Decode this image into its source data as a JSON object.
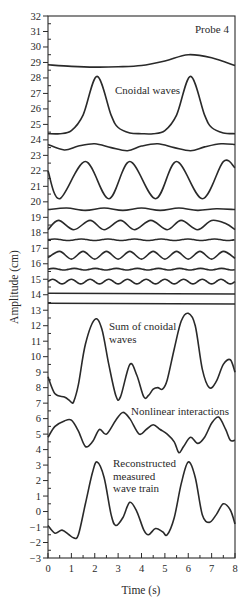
{
  "chart_data": {
    "type": "line",
    "title": "",
    "annotation_title": "Probe 4",
    "xlabel": "Time (s)",
    "ylabel": "Amplitude (cm)",
    "xlim": [
      0,
      8
    ],
    "ylim": [
      -3,
      32
    ],
    "x_ticks": [
      0,
      1,
      2,
      3,
      4,
      5,
      6,
      7,
      8
    ],
    "y_ticks": [
      -3,
      -2,
      -1,
      0,
      1,
      2,
      3,
      4,
      5,
      6,
      7,
      8,
      9,
      10,
      11,
      12,
      13,
      14,
      15,
      16,
      17,
      18,
      19,
      20,
      21,
      22,
      23,
      24,
      25,
      26,
      27,
      28,
      29,
      30,
      31,
      32
    ],
    "grid": false,
    "legend": "none",
    "annotations": [
      {
        "text": "Probe 4",
        "x": 6.9,
        "y": 30.8
      },
      {
        "text": "Cnoidal waves",
        "x": 3.0,
        "y": 26.9
      },
      {
        "text": "Sum of cnoidal waves",
        "x": 3.5,
        "y": 12.0
      },
      {
        "text": "Nonlinear interactions",
        "x": 3.5,
        "y": 6.4
      },
      {
        "text": "Reconstructed measured wave train",
        "x": 2.8,
        "y": 3.0
      }
    ],
    "series": [
      {
        "name": "Cnoidal wave 1",
        "group": "Cnoidal waves",
        "baseline": 28.7,
        "amplitude": 0.8,
        "period": 8.0,
        "crest_times": [
          6.0
        ],
        "min": 28.7,
        "max": 29.5,
        "x": [
          0,
          1,
          2,
          3,
          4,
          5,
          6,
          7,
          8
        ],
        "values": [
          28.85,
          28.75,
          28.7,
          28.72,
          28.8,
          29.1,
          29.5,
          29.3,
          28.8
        ]
      },
      {
        "name": "Cnoidal wave 2",
        "group": "Cnoidal waves",
        "min": 24.4,
        "max": 28.1,
        "period": 4.0,
        "crest_times": [
          2.1,
          6.1
        ],
        "x": [
          0,
          0.5,
          1,
          1.5,
          2.1,
          2.7,
          3,
          3.5,
          4,
          4.5,
          5,
          5.5,
          6.1,
          6.7,
          7,
          7.5,
          8
        ],
        "values": [
          24.4,
          24.4,
          24.6,
          25.6,
          28.1,
          25.6,
          24.8,
          24.45,
          24.4,
          24.4,
          24.6,
          25.6,
          28.1,
          25.6,
          24.8,
          24.45,
          24.4
        ]
      },
      {
        "name": "Cnoidal wave 3",
        "group": "Cnoidal waves",
        "min": 23.3,
        "max": 23.8,
        "period": 2.7,
        "x": [
          0,
          0.7,
          1.3,
          2.0,
          2.7,
          3.4,
          4.0,
          4.7,
          5.4,
          6.1,
          6.7,
          7.4,
          8
        ],
        "values": [
          23.7,
          23.35,
          23.6,
          23.75,
          23.5,
          23.3,
          23.6,
          23.75,
          23.5,
          23.3,
          23.55,
          23.75,
          23.7
        ]
      },
      {
        "name": "Cnoidal wave 4",
        "group": "Cnoidal waves",
        "min": 20.2,
        "max": 22.6,
        "period": 2.0,
        "crest_times": [
          1.6,
          3.5,
          5.5,
          7.5
        ],
        "x": [
          0,
          0.5,
          1.6,
          2.6,
          3.5,
          4.6,
          5.5,
          6.6,
          7.5,
          8
        ],
        "values": [
          22.0,
          20.2,
          22.6,
          20.2,
          22.6,
          20.2,
          22.6,
          20.2,
          22.6,
          22.2
        ]
      },
      {
        "name": "Cnoidal wave 5",
        "group": "Cnoidal waves",
        "min": 19.4,
        "max": 19.6,
        "period": 1.6,
        "x": [
          0,
          0.8,
          1.6,
          2.4,
          3.2,
          4.0,
          4.8,
          5.6,
          6.4,
          7.2,
          8
        ],
        "values": [
          19.5,
          19.6,
          19.45,
          19.6,
          19.45,
          19.6,
          19.45,
          19.6,
          19.45,
          19.55,
          19.5
        ]
      },
      {
        "name": "Cnoidal wave 6",
        "group": "Cnoidal waves",
        "min": 18.2,
        "max": 18.8,
        "period": 1.33,
        "x": [
          0,
          0.45,
          1.1,
          1.8,
          2.4,
          3.1,
          3.7,
          4.4,
          5.1,
          5.7,
          6.4,
          7.0,
          7.6,
          8
        ],
        "values": [
          18.2,
          18.8,
          18.2,
          18.8,
          18.2,
          18.8,
          18.2,
          18.8,
          18.2,
          18.8,
          18.2,
          18.8,
          18.6,
          18.2
        ]
      },
      {
        "name": "Cnoidal wave 7",
        "group": "Cnoidal waves",
        "min": 17.5,
        "max": 17.6,
        "period": 1.14,
        "x": [
          0,
          8
        ],
        "values": [
          17.55,
          17.55
        ]
      },
      {
        "name": "Cnoidal wave 8",
        "group": "Cnoidal waves",
        "min": 16.3,
        "max": 16.8,
        "period": 1.0,
        "x": [
          0,
          0.5,
          1.0,
          1.5,
          2.0,
          2.5,
          3.0,
          3.5,
          4.0,
          4.5,
          5.0,
          5.5,
          6.0,
          6.5,
          7.0,
          7.5,
          8
        ],
        "values": [
          16.4,
          16.8,
          16.3,
          16.8,
          16.3,
          16.8,
          16.3,
          16.8,
          16.3,
          16.8,
          16.3,
          16.8,
          16.3,
          16.8,
          16.3,
          16.8,
          16.35
        ]
      },
      {
        "name": "Cnoidal wave 9",
        "group": "Cnoidal waves",
        "min": 15.6,
        "max": 15.7,
        "period": 0.9,
        "x": [
          0,
          8
        ],
        "values": [
          15.65,
          15.65
        ]
      },
      {
        "name": "Cnoidal wave 10",
        "group": "Cnoidal waves",
        "min": 14.7,
        "max": 15.0,
        "period": 0.8,
        "x": [
          0,
          8
        ],
        "values": [
          14.85,
          14.85
        ]
      },
      {
        "name": "Cnoidal wave 11",
        "group": "Cnoidal waves",
        "min": 14.05,
        "max": 14.1,
        "x": [
          0,
          8
        ],
        "values": [
          14.1,
          14.05
        ]
      },
      {
        "name": "Cnoidal wave 12",
        "group": "Cnoidal waves",
        "min": 13.4,
        "max": 13.45,
        "x": [
          0,
          8
        ],
        "values": [
          13.45,
          13.4
        ]
      },
      {
        "name": "Sum of cnoidal waves",
        "x": [
          0,
          0.3,
          0.7,
          0.9,
          1.0,
          1.1,
          1.3,
          1.6,
          2.0,
          2.3,
          2.6,
          2.9,
          3.1,
          3.5,
          3.8,
          4.1,
          4.3,
          4.5,
          4.7,
          4.9,
          5.1,
          5.4,
          5.7,
          6.0,
          6.3,
          6.6,
          6.9,
          7.2,
          7.5,
          7.8,
          8.0
        ],
        "values": [
          8.7,
          7.6,
          7.4,
          7.2,
          7.05,
          7.1,
          8.2,
          10.8,
          12.4,
          11.8,
          9.5,
          7.5,
          7.4,
          9.5,
          8.8,
          7.4,
          7.5,
          7.9,
          8.0,
          7.9,
          8.5,
          10.5,
          12.3,
          12.8,
          12.0,
          9.2,
          8.0,
          8.4,
          9.5,
          9.8,
          9.0
        ]
      },
      {
        "name": "Nonlinear interactions",
        "x": [
          0,
          0.3,
          0.7,
          1.0,
          1.3,
          1.6,
          1.9,
          2.2,
          2.5,
          2.9,
          3.2,
          3.5,
          3.9,
          4.2,
          4.5,
          4.8,
          5.1,
          5.4,
          5.6,
          5.8,
          6.1,
          6.4,
          6.7,
          7.0,
          7.3,
          7.6,
          7.8,
          8.0
        ],
        "values": [
          4.8,
          5.5,
          5.85,
          5.9,
          5.2,
          4.2,
          4.5,
          5.3,
          5.0,
          5.9,
          6.4,
          6.0,
          5.0,
          5.3,
          5.6,
          5.3,
          5.0,
          4.5,
          3.8,
          4.2,
          4.8,
          4.4,
          4.8,
          5.7,
          6.1,
          5.3,
          4.6,
          4.6
        ]
      },
      {
        "name": "Reconstructed measured wave train",
        "x": [
          0,
          0.3,
          0.6,
          0.9,
          1.1,
          1.3,
          1.6,
          1.9,
          2.1,
          2.4,
          2.7,
          2.9,
          3.2,
          3.5,
          3.8,
          4.1,
          4.3,
          4.6,
          4.9,
          5.1,
          5.4,
          5.7,
          6.0,
          6.3,
          6.6,
          6.9,
          7.2,
          7.5,
          7.8,
          8.0
        ],
        "values": [
          -0.9,
          -1.4,
          -1.2,
          -1.5,
          -1.7,
          -1.5,
          0.5,
          2.5,
          3.2,
          2.2,
          -0.2,
          -0.9,
          -0.4,
          0.6,
          0.0,
          -1.2,
          -1.5,
          -1.1,
          -1.3,
          -1.5,
          -0.4,
          1.8,
          3.2,
          2.2,
          -0.2,
          -0.7,
          -0.2,
          0.5,
          0.1,
          -0.8
        ]
      }
    ]
  }
}
